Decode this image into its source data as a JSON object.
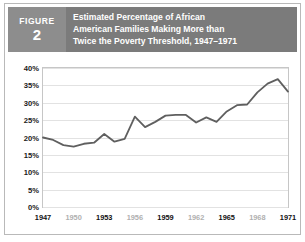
{
  "figure": {
    "badge_word": "FIGURE",
    "badge_number": "2",
    "title_lines": [
      "Estimated Percentage of African",
      "American Families Making More than",
      "Twice the Poverty Threshold, 1947–1971"
    ],
    "badge_color": "#8d8d8d",
    "title_bar_color": "#7b7b7b",
    "border_color": "#b9b9b9"
  },
  "chart_data": {
    "type": "line",
    "title": "Estimated Percentage of African American Families Making More than Twice the Poverty Threshold, 1947–1971",
    "xlabel": "",
    "ylabel": "",
    "ylim": [
      0,
      40
    ],
    "xlim": [
      1947,
      1971
    ],
    "grid": true,
    "legend": false,
    "line_color": "#5f5f5f",
    "ytick_labels": [
      "0%",
      "5%",
      "10%",
      "15%",
      "20%",
      "25%",
      "30%",
      "35%",
      "40%"
    ],
    "ytick_values": [
      0,
      5,
      10,
      15,
      20,
      25,
      30,
      35,
      40
    ],
    "xtick_labels": [
      "1947",
      "1950",
      "1953",
      "1956",
      "1959",
      "1962",
      "1965",
      "1968",
      "1971"
    ],
    "xtick_values": [
      1947,
      1950,
      1953,
      1956,
      1959,
      1962,
      1965,
      1968,
      1971
    ],
    "xtick_emphasis": [
      "major",
      "minor",
      "major",
      "minor",
      "major",
      "minor",
      "major",
      "minor",
      "major"
    ],
    "x": [
      1947,
      1948,
      1949,
      1950,
      1951,
      1952,
      1953,
      1954,
      1955,
      1956,
      1957,
      1958,
      1959,
      1960,
      1961,
      1962,
      1963,
      1964,
      1965,
      1966,
      1967,
      1968,
      1969,
      1970,
      1971
    ],
    "values": [
      20.0,
      19.3,
      17.8,
      17.4,
      18.2,
      18.5,
      21.0,
      18.8,
      19.6,
      26.0,
      23.0,
      24.5,
      26.3,
      26.5,
      26.5,
      24.3,
      25.8,
      24.5,
      27.5,
      29.3,
      29.5,
      33.0,
      35.5,
      36.8,
      33.2
    ],
    "series": [
      {
        "name": "Percentage of African American families above twice the poverty threshold",
        "values": [
          20.0,
          19.3,
          17.8,
          17.4,
          18.2,
          18.5,
          21.0,
          18.8,
          19.6,
          26.0,
          23.0,
          24.5,
          26.3,
          26.5,
          26.5,
          24.3,
          25.8,
          24.5,
          27.5,
          29.3,
          29.5,
          33.0,
          35.5,
          36.8,
          33.2
        ]
      }
    ]
  }
}
